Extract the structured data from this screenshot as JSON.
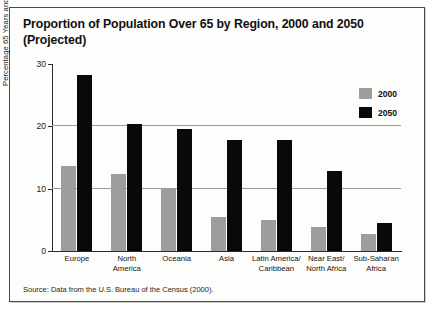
{
  "chart_data": {
    "type": "bar",
    "title": "Proportion of Population Over 65 by Region, 2000 and 2050 (Projected)",
    "xlabel": "",
    "ylabel": "Percentage 65 Years and Older",
    "ylim": [
      0,
      30
    ],
    "yticks": [
      0,
      10,
      20,
      30
    ],
    "grid": true,
    "legend_position": "top-right",
    "categories": [
      "Europe",
      "North America",
      "Oceania",
      "Asia",
      "Latin America/ Caribbean",
      "Near East/ North Africa",
      "Sub-Saharan Africa"
    ],
    "series": [
      {
        "name": "2000",
        "color": "#9d9d9d",
        "values": [
          13.7,
          12.4,
          10.0,
          5.5,
          4.9,
          3.8,
          2.8
        ]
      },
      {
        "name": "2050",
        "color": "#090909",
        "values": [
          28.2,
          20.4,
          19.6,
          17.8,
          17.8,
          12.8,
          4.5
        ]
      }
    ],
    "source": "Source: Data from the U.S. Bureau of the Census (2000)."
  },
  "category_lines": [
    [
      "Europe"
    ],
    [
      "North",
      "America"
    ],
    [
      "Oceania"
    ],
    [
      "Asia"
    ],
    [
      "Latin America/",
      "Caribbean"
    ],
    [
      "Near East/",
      "North Africa"
    ],
    [
      "Sub-Saharan",
      "Africa"
    ]
  ],
  "colors": {
    "series_2000": "#9d9d9d",
    "series_2050": "#090909",
    "frame_border": "#4a4a4a",
    "gridline": "#9a9a9a",
    "axis": "#2a2a2a",
    "background": "#fdfdfb"
  }
}
